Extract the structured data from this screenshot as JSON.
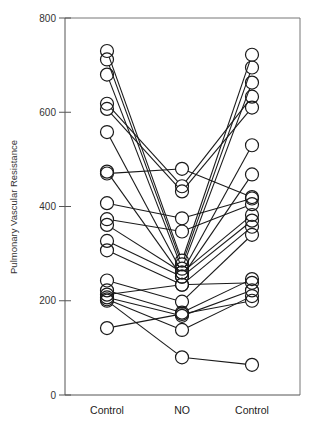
{
  "chart_data": {
    "type": "line",
    "title": "",
    "xlabel": "",
    "ylabel": "Pulmonary Vascular Resistance",
    "categories": [
      "Control",
      "NO",
      "Control"
    ],
    "ylim": [
      0,
      800
    ],
    "yticks": [
      0,
      200,
      400,
      600,
      800
    ],
    "grid": false,
    "legend": null,
    "marker": "open-circle",
    "series": [
      {
        "name": "subject-1",
        "values": [
          730,
          285,
          722
        ]
      },
      {
        "name": "subject-2",
        "values": [
          712,
          277,
          695
        ]
      },
      {
        "name": "subject-3",
        "values": [
          680,
          268,
          663
        ]
      },
      {
        "name": "subject-4",
        "values": [
          618,
          443,
          633
        ]
      },
      {
        "name": "subject-5",
        "values": [
          607,
          432,
          610
        ]
      },
      {
        "name": "subject-6",
        "values": [
          558,
          260,
          530
        ]
      },
      {
        "name": "subject-7",
        "values": [
          474,
          251,
          468
        ]
      },
      {
        "name": "subject-8",
        "values": [
          470,
          480,
          420
        ]
      },
      {
        "name": "subject-9",
        "values": [
          407,
          375,
          417
        ]
      },
      {
        "name": "subject-10",
        "values": [
          373,
          347,
          405
        ]
      },
      {
        "name": "subject-11",
        "values": [
          361,
          260,
          382
        ]
      },
      {
        "name": "subject-12",
        "values": [
          327,
          251,
          370
        ]
      },
      {
        "name": "subject-13",
        "values": [
          307,
          234,
          357
        ]
      },
      {
        "name": "subject-14",
        "values": [
          243,
          198,
          340
        ]
      },
      {
        "name": "subject-15",
        "values": [
          222,
          175,
          246
        ]
      },
      {
        "name": "subject-16",
        "values": [
          213,
          234,
          238
        ]
      },
      {
        "name": "subject-17",
        "values": [
          207,
          168,
          222
        ]
      },
      {
        "name": "subject-18",
        "values": [
          203,
          138,
          210
        ]
      },
      {
        "name": "subject-19",
        "values": [
          200,
          80,
          64
        ]
      },
      {
        "name": "subject-20",
        "values": [
          142,
          172,
          200
        ]
      }
    ]
  },
  "axis": {
    "y_title": "Pulmonary Vascular Resistance",
    "y_tick_labels": [
      "0",
      "200",
      "400",
      "600",
      "800"
    ],
    "x_labels": [
      "Control",
      "NO",
      "Control"
    ]
  }
}
